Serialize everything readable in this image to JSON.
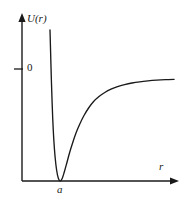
{
  "figure": {
    "background_color": "#ffffff",
    "line_color": "#1a1a1a",
    "width": 188,
    "height": 207
  },
  "axes": {
    "y_axis_label": "U(r)",
    "x_axis_label": "r",
    "y_tick_label": "0",
    "x_tick_label": "a",
    "y_axis_name": "vertical-axis",
    "x_axis_name": "horizontal-axis"
  },
  "chart_data": {
    "type": "line",
    "title": "",
    "subtitle": "",
    "xlabel": "r",
    "ylabel": "U(r)",
    "legend": [],
    "legend_position": "none",
    "grid": false,
    "annotations": [
      {
        "text": "0",
        "axis": "y",
        "meaning": "zero level marked on vertical axis",
        "pixel_y": 69
      },
      {
        "text": "a",
        "axis": "x",
        "meaning": "equilibrium separation at curve minimum",
        "pixel_x": 61
      }
    ],
    "axis_arrows": {
      "x": true,
      "y": true
    },
    "xlim": [
      0,
      1
    ],
    "ylim": [
      0,
      1
    ],
    "series": [
      {
        "name": "U(r)",
        "color": "#1a1a1a",
        "points": [
          [
            50.0,
            30.0
          ],
          [
            50.6,
            52.0
          ],
          [
            51.2,
            74.0
          ],
          [
            51.9,
            96.0
          ],
          [
            52.7,
            118.0
          ],
          [
            53.7,
            138.0
          ],
          [
            55.0,
            156.0
          ],
          [
            56.6,
            170.0
          ],
          [
            58.4,
            178.5
          ],
          [
            60.3,
            181.0
          ],
          [
            62.2,
            178.5
          ],
          [
            64.3,
            172.0
          ],
          [
            66.8,
            163.0
          ],
          [
            69.5,
            153.0
          ],
          [
            72.6,
            143.0
          ],
          [
            76.0,
            133.0
          ],
          [
            79.8,
            124.0
          ],
          [
            84.0,
            115.5
          ],
          [
            88.6,
            108.0
          ],
          [
            93.6,
            101.5
          ],
          [
            99.0,
            96.5
          ],
          [
            104.8,
            92.5
          ],
          [
            111.0,
            89.2
          ],
          [
            117.6,
            86.6
          ],
          [
            124.6,
            84.6
          ],
          [
            132.0,
            83.0
          ],
          [
            139.8,
            81.8
          ],
          [
            148.0,
            80.9
          ],
          [
            156.6,
            80.2
          ],
          [
            165.6,
            79.7
          ],
          [
            174.0,
            79.4
          ]
        ]
      }
    ]
  }
}
